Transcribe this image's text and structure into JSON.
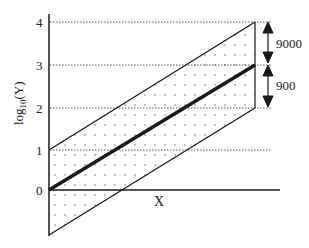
{
  "diagram": {
    "y_axis_label_base": "log",
    "y_axis_label_sub": "10",
    "y_axis_label_arg": "(Y)",
    "x_axis_label": "X",
    "y_ticks": [
      "0",
      "1",
      "2",
      "3",
      "4"
    ],
    "annotations": {
      "upper_interval": "9000",
      "lower_interval": "900"
    },
    "colors": {
      "line": "#1a1a1a",
      "grid": "#555555",
      "dots": "#555555"
    }
  }
}
